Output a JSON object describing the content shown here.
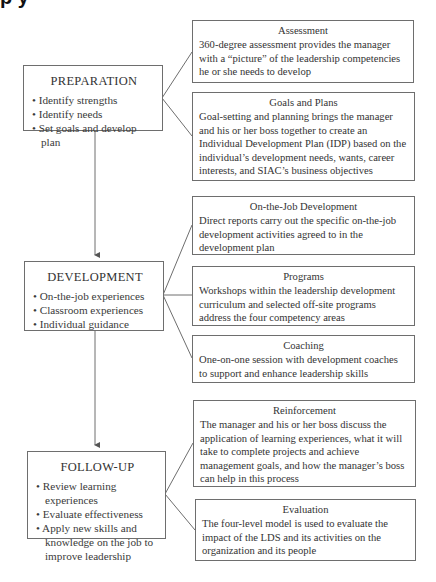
{
  "header_fragment": "p        y",
  "stages": [
    {
      "title": "PREPARATION",
      "bullets": [
        "Identify strengths",
        "Identify needs",
        "Set goals and develop plan"
      ]
    },
    {
      "title": "DEVELOPMENT",
      "bullets": [
        "On-the-job experiences",
        "Classroom experiences",
        "Individual guidance"
      ]
    },
    {
      "title": "FOLLOW-UP",
      "bullets": [
        "Review learning experiences",
        "Evaluate effectiveness",
        "Apply new skills and knowledge on the job to improve leadership"
      ]
    }
  ],
  "details": [
    {
      "title": "Assessment",
      "desc": "360-degree assessment provides the manager with a “picture” of the leadership competencies he or she needs to develop"
    },
    {
      "title": "Goals and Plans",
      "desc": "Goal-setting and planning brings the manager and his or her boss together to create an Individual Development Plan (IDP) based on the individual’s development needs, wants, career interests, and SIAC’s business objectives"
    },
    {
      "title": "On-the-Job Development",
      "desc": "Direct reports carry out the specific on-the-job development activities agreed to in the development plan"
    },
    {
      "title": "Programs",
      "desc": "Workshops within the leadership development curriculum and selected off-site programs address the four competency areas"
    },
    {
      "title": "Coaching",
      "desc": "One-on-one session with development coaches to support and enhance leadership skills"
    },
    {
      "title": "Reinforcement",
      "desc": "The manager and his or her boss discuss the application of learning experiences, what it will take to complete projects and achieve management goals, and how the manager’s boss can help in this process"
    },
    {
      "title": "Evaluation",
      "desc": "The four-level model is used to evaluate the impact of the LDS and its activities on the organization and its people"
    }
  ],
  "colors": {
    "line": "#6e6e6e",
    "text": "#333333",
    "background": "#ffffff"
  }
}
